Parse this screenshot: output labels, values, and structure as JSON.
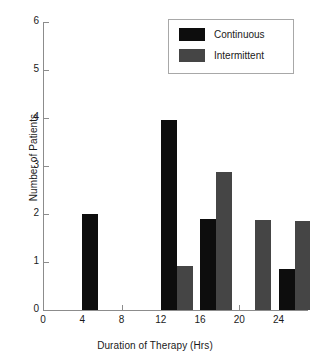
{
  "chart_data": {
    "type": "bar",
    "title": "",
    "xlabel": "Duration of Therapy (Hrs)",
    "ylabel": "Number of Patients",
    "xlim": [
      0,
      27
    ],
    "ylim": [
      0,
      6
    ],
    "xticks": [
      0,
      4,
      8,
      12,
      16,
      20,
      24
    ],
    "xtick_labels": [
      "0",
      "4",
      "8",
      "12",
      "16",
      "20",
      "24"
    ],
    "yticks": [
      0,
      1,
      2,
      3,
      4,
      5,
      6
    ],
    "ytick_labels": [
      "0",
      "1",
      "2",
      "3",
      "4",
      "5",
      "6"
    ],
    "grid": false,
    "legend_position": "top-right",
    "categories": [
      4,
      8,
      12,
      16,
      20,
      24
    ],
    "series": [
      {
        "name": "Continuous",
        "color": "#0d0d0d",
        "values": [
          2,
          0,
          3.95,
          1.9,
          0,
          0.85
        ],
        "bars": [
          {
            "x": 4,
            "value": 2
          },
          {
            "x": 12,
            "value": 3.95
          },
          {
            "x": 16,
            "value": 1.9
          },
          {
            "x": 24,
            "value": 0.85
          }
        ]
      },
      {
        "name": "Intermittent",
        "color": "#454545",
        "values": [
          0,
          0,
          0.92,
          2.88,
          1.88,
          1.85
        ],
        "bars": [
          {
            "x": 12,
            "value": 0.92
          },
          {
            "x": 16,
            "value": 2.88
          },
          {
            "x": 20,
            "value": 1.88
          },
          {
            "x": 24,
            "value": 1.85
          }
        ]
      }
    ],
    "legend": [
      {
        "label": "Continuous",
        "color": "#0d0d0d"
      },
      {
        "label": "Intermittent",
        "color": "#454545"
      }
    ],
    "axis_color": "#8c8c8c",
    "background": "#ffffff"
  }
}
